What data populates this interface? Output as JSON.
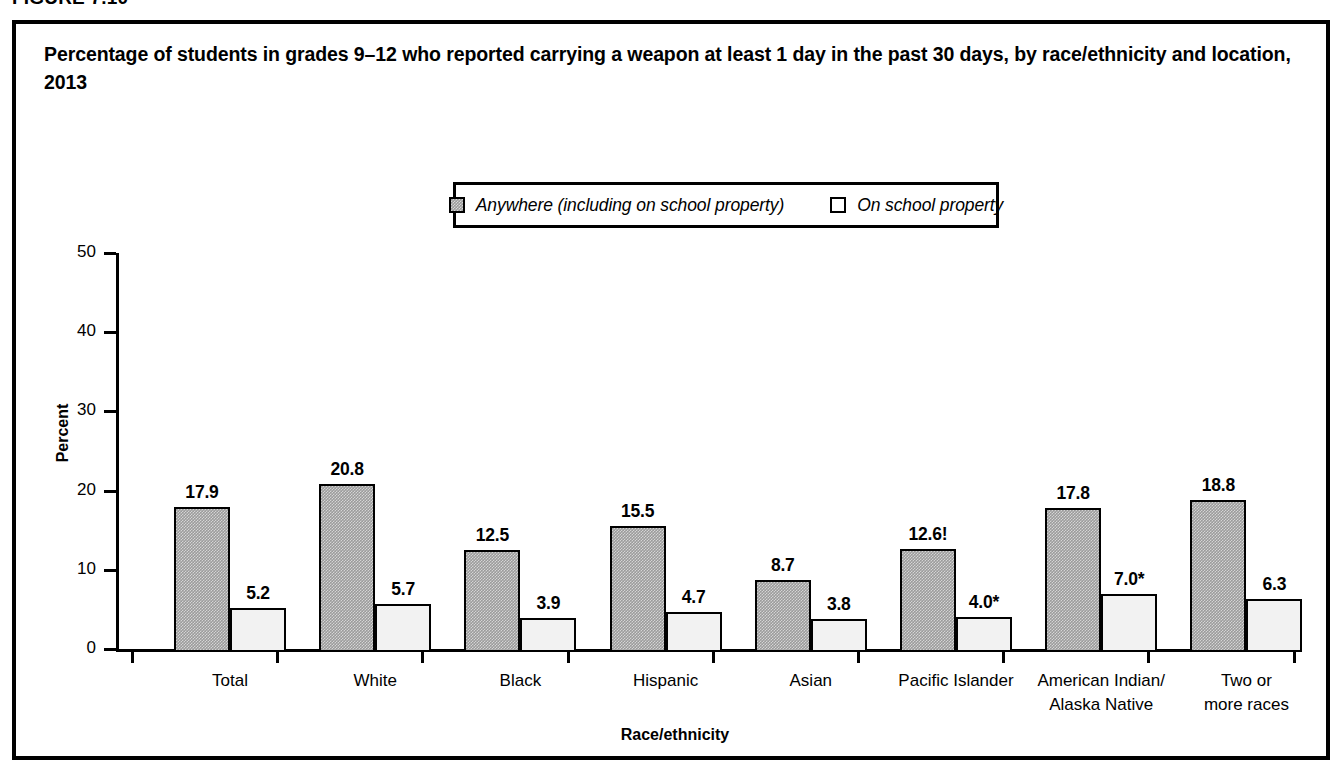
{
  "figure_number": "FIGURE 7.10",
  "title": "Percentage of students in grades 9–12 who reported carrying a weapon at least 1 day in the past 30 days, by race/ethnicity and location, 2013",
  "legend": {
    "items": [
      {
        "label": "Anywhere (including on school property)",
        "swatch": "hatched-gray-square",
        "color": "#9b9b9b"
      },
      {
        "label": "On school property",
        "swatch": "white-square",
        "color": "#ffffff"
      }
    ]
  },
  "chart_data": {
    "type": "bar",
    "title": "Percentage of students in grades 9–12 who reported carrying a weapon at least 1 day in the past 30 days, by race/ethnicity and location, 2013",
    "xlabel": "Race/ethnicity",
    "ylabel": "Percent",
    "ylim": [
      0,
      50
    ],
    "yticks": [
      "0",
      "10",
      "20",
      "30",
      "40",
      "50"
    ],
    "grid": false,
    "legend_position": "top-center",
    "categories": [
      "Total",
      "White",
      "Black",
      "Hispanic",
      "Asian",
      "Pacific Islander",
      "American Indian/\nAlaska Native",
      "Two or\nmore races"
    ],
    "category_lines": [
      [
        "Total",
        ""
      ],
      [
        "White",
        ""
      ],
      [
        "Black",
        ""
      ],
      [
        "Hispanic",
        ""
      ],
      [
        "Asian",
        ""
      ],
      [
        "Pacific Islander",
        ""
      ],
      [
        "American Indian/",
        "Alaska Native"
      ],
      [
        "Two or",
        "more races"
      ]
    ],
    "series": [
      {
        "name": "Anywhere (including on school property)",
        "values": [
          17.9,
          20.8,
          12.5,
          15.5,
          8.7,
          12.6,
          17.8,
          18.8
        ],
        "labels": [
          "17.9",
          "20.8",
          "12.5",
          "15.5",
          "8.7",
          "12.6!",
          "17.8",
          "18.8"
        ]
      },
      {
        "name": "On school property",
        "values": [
          5.2,
          5.7,
          3.9,
          4.7,
          3.8,
          4.0,
          7.0,
          6.3
        ],
        "labels": [
          "5.2",
          "5.7",
          "3.9",
          "4.7",
          "3.8",
          "4.0*",
          "7.0*",
          "6.3"
        ]
      }
    ]
  }
}
